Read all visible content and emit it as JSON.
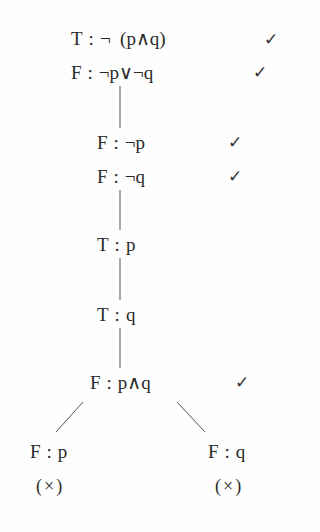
{
  "tableau": {
    "nodes": [
      {
        "sign": "T",
        "sep": ":",
        "formula": "¬  (p∧q)",
        "check": "✓"
      },
      {
        "sign": "F",
        "sep": ":",
        "formula": "¬p∨¬q",
        "check": "✓"
      },
      {
        "sign": "F",
        "sep": ":",
        "formula": "¬p",
        "check": "✓"
      },
      {
        "sign": "F",
        "sep": ":",
        "formula": "¬q",
        "check": "✓"
      },
      {
        "sign": "T",
        "sep": ":",
        "formula": "p"
      },
      {
        "sign": "T",
        "sep": ":",
        "formula": "q"
      },
      {
        "sign": "F",
        "sep": ":",
        "formula": "p∧q",
        "check": "✓"
      }
    ],
    "branches": [
      {
        "sign": "F",
        "sep": ":",
        "formula": "p",
        "closed": "(×)"
      },
      {
        "sign": "F",
        "sep": ":",
        "formula": "q",
        "closed": "(×)"
      }
    ]
  }
}
